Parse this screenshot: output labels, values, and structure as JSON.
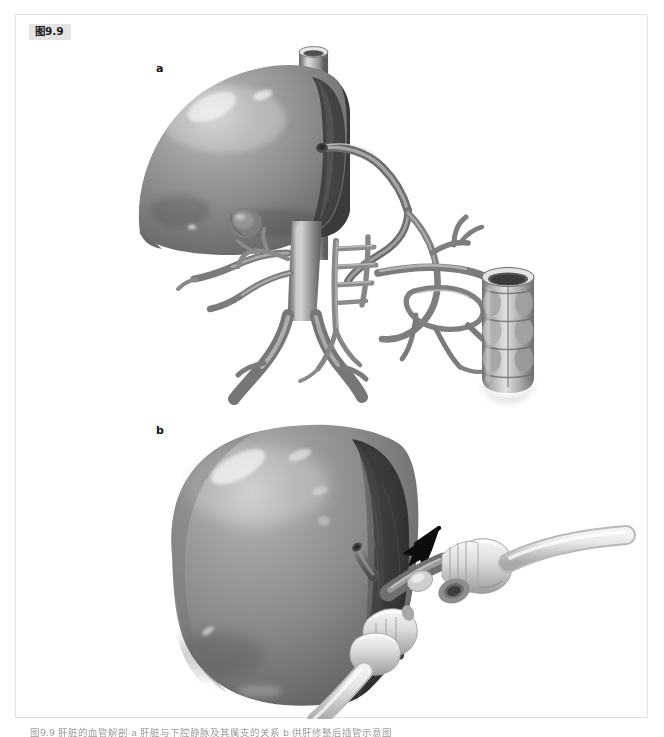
{
  "page": {
    "figure_badge": "图9.9",
    "caption": "图9.9  肝脏的血管解剖 a 肝脏与下腔静脉及其属支的关系 b 供肝修整后插管示意图",
    "background_color": "#ffffff",
    "panel_border_color": "#e2e2e2",
    "badge_background": "#e4e4e4"
  },
  "panels": [
    {
      "letter": "a",
      "name": "vascular-anatomy-panel",
      "description": "Grayscale medical illustration of the liver with inferior vena cava and the surrounding arterial / portal venous branching network, plus a segment of bowel at the right",
      "structures": [
        "liver",
        "gallbladder",
        "inferior-vena-cava",
        "aorta",
        "celiac-trunk",
        "superior-mesenteric-artery",
        "renal-arteries",
        "iliac-bifurcation",
        "bowel-segment"
      ]
    },
    {
      "letter": "b",
      "name": "cannulated-graft-panel",
      "description": "Grayscale medical illustration of a prepared donor liver graft viewed from the cut surface, with perfusion cannulas and tubing inserted; a black arrow indicates the hilar structures",
      "structures": [
        "liver-graft",
        "cut-surface",
        "portal-vein-cannula",
        "hepatic-artery-cannula",
        "bile-duct-cannula",
        "perfusion-tubing",
        "indicator-arrow"
      ]
    }
  ],
  "colors": {
    "liver_mid": "#8b8b8b",
    "liver_dark": "#5d5d5d",
    "liver_highlight": "#d8d8d8",
    "cut_surface": "#333333",
    "vessel_mid": "#8f8f8f",
    "vessel_dark": "#5a5a5a",
    "vessel_light": "#c9c9c9",
    "tubing": "#dcdcdc",
    "arrow": "#111111"
  }
}
